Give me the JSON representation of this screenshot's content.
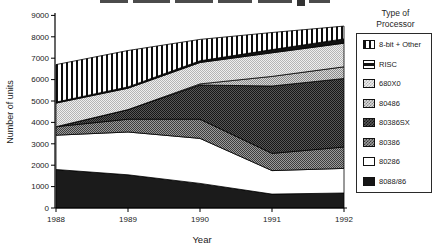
{
  "colors": {
    "ink": "#1a1a1a",
    "background": "#ffffff"
  },
  "y_axis": {
    "label": "Number of units",
    "ticks": [
      "0",
      "1000",
      "2000",
      "3000",
      "4000",
      "5000",
      "6000",
      "7000",
      "8000",
      "9000"
    ]
  },
  "x_axis": {
    "label": "Year",
    "ticks": [
      "1988",
      "1989",
      "1990",
      "1991",
      "1992"
    ]
  },
  "legend": {
    "title_line1": "Type of",
    "title_line2": "Processor",
    "items": [
      {
        "label": "8-bit + Other",
        "pattern": "vertical-stripes"
      },
      {
        "label": "RISC",
        "pattern": "horizontal-bar"
      },
      {
        "label": "680X0",
        "pattern": "checker-light"
      },
      {
        "label": "80486",
        "pattern": "checker-medium"
      },
      {
        "label": "80386SX",
        "pattern": "checker-dark"
      },
      {
        "label": "80386",
        "pattern": "checker-medium-dark"
      },
      {
        "label": "80286",
        "pattern": "white"
      },
      {
        "label": "8088/86",
        "pattern": "solid-black"
      }
    ]
  },
  "chart_data": {
    "type": "area",
    "stacked": true,
    "x": [
      1988,
      1989,
      1990,
      1991,
      1992
    ],
    "xlabel": "Year",
    "ylabel": "Number of units",
    "ylim": [
      0,
      9000
    ],
    "y_tick_step": 1000,
    "grid": false,
    "legend_position": "right",
    "series_bottom_to_top": [
      {
        "name": "8088/86",
        "values": [
          1800,
          1550,
          1150,
          650,
          700
        ],
        "pattern": "solid-black"
      },
      {
        "name": "80286",
        "values": [
          1600,
          2000,
          2100,
          1100,
          1150
        ],
        "pattern": "white"
      },
      {
        "name": "80386",
        "values": [
          400,
          600,
          900,
          800,
          1000
        ],
        "pattern": "checker-medium-dark"
      },
      {
        "name": "80386SX",
        "values": [
          0,
          450,
          1600,
          3150,
          3200
        ],
        "pattern": "checker-dark"
      },
      {
        "name": "80486",
        "values": [
          0,
          0,
          50,
          450,
          550
        ],
        "pattern": "checker-medium"
      },
      {
        "name": "680X0",
        "values": [
          1100,
          1000,
          1000,
          1100,
          1100
        ],
        "pattern": "checker-light"
      },
      {
        "name": "RISC",
        "values": [
          50,
          60,
          80,
          150,
          200
        ],
        "pattern": "solid-black-thin"
      },
      {
        "name": "8-bit + Other",
        "values": [
          1750,
          1700,
          1000,
          800,
          600
        ],
        "pattern": "vertical-stripes"
      }
    ],
    "totals_by_year": [
      6700,
      7360,
      7880,
      8200,
      8500
    ]
  }
}
